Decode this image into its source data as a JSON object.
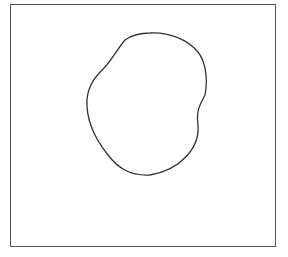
{
  "canvas": {
    "background": "#ffffff",
    "frame": {
      "x": 10,
      "y": 4,
      "width": 266,
      "height": 243,
      "stroke": "#555555"
    },
    "shape": {
      "kind": "closed-irregular-blob",
      "stroke": "#333333",
      "fill": "none",
      "path": "M150,33 C170,32 188,40 198,52 C206,62 208,80 205,95 C200,105 196,110 198,125 C200,148 180,170 150,175 C130,176 118,168 108,155 C96,140 86,120 87,100 C88,85 96,76 104,68 C112,60 118,48 125,40 C132,35 140,33 150,33 Z"
    }
  }
}
